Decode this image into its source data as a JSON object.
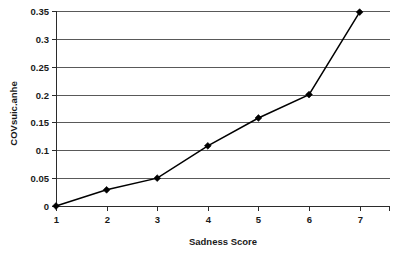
{
  "chart_data": {
    "type": "line",
    "title": "",
    "xlabel": "Sadness Score",
    "ylabel": "COVsuic.anhe",
    "x": [
      1,
      2,
      3,
      4,
      5,
      6,
      7
    ],
    "values": [
      0,
      0.029,
      0.05,
      0.108,
      0.158,
      0.2,
      0.348
    ],
    "series": [
      {
        "name": "COVsuic.anhe",
        "values": [
          0,
          0.029,
          0.05,
          0.108,
          0.158,
          0.2,
          0.348
        ]
      }
    ],
    "xlim": [
      1,
      7.6
    ],
    "ylim": [
      0,
      0.35
    ],
    "xticks": [
      "1",
      "2",
      "3",
      "4",
      "5",
      "6",
      "7"
    ],
    "yticks": [
      "0",
      "0.05",
      "0.1",
      "0.15",
      "0.2",
      "0.25",
      "0.3",
      "0.35"
    ],
    "ytick_values": [
      0,
      0.05,
      0.1,
      0.15,
      0.2,
      0.25,
      0.3,
      0.35
    ],
    "grid": "horizontal",
    "legend": "none",
    "marker": "diamond",
    "line_color": "#000000",
    "grid_color": "#595959",
    "background": "#ffffff"
  }
}
